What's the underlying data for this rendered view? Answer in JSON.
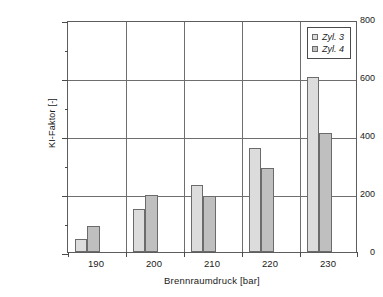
{
  "chart_data": {
    "type": "bar",
    "title": "",
    "xlabel": "Brennraumdruck [bar]",
    "ylabel": "KI-Faktor [-]",
    "categories": [
      "190",
      "200",
      "210",
      "220",
      "230"
    ],
    "series": [
      {
        "name": "Zyl. 3",
        "color": "#dcdcdc",
        "values": [
          45,
          150,
          232,
          360,
          602
        ]
      },
      {
        "name": "Zyl. 4",
        "color": "#bfbfbf",
        "values": [
          90,
          197,
          192,
          290,
          410
        ]
      }
    ],
    "ylim": [
      0,
      800
    ],
    "yticks": [
      0,
      200,
      400,
      600,
      800
    ],
    "ytick_labels": [
      "0",
      "200",
      "400",
      "600",
      "800"
    ],
    "yminor_ticks": [
      100,
      300,
      500,
      700
    ],
    "grid": "both",
    "legend_position": "top-right",
    "legend_entries": [
      "Zyl. 3",
      "Zyl. 4"
    ]
  }
}
